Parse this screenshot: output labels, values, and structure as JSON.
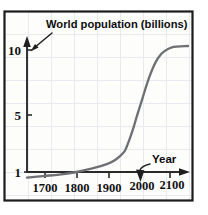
{
  "figure": {
    "name": "world-population-growth-curve",
    "background_color": "#fdfdfc",
    "border_color": "#1c1c1c",
    "grid_color": "#e7e9ee",
    "curve_color": "#6d6f72",
    "axis_color": "#2a2a2a"
  },
  "annotations": {
    "title": "World population (billions)",
    "year": "Year"
  },
  "chart_data": {
    "type": "line",
    "title": "World population (billions)",
    "xlabel": "Year",
    "ylabel": "World population (billions)",
    "xlim": [
      1650,
      2150
    ],
    "ylim": [
      0,
      12
    ],
    "grid": true,
    "legend": false,
    "xticks": [
      1700,
      1800,
      1900,
      2000,
      2100
    ],
    "xtick_labels": [
      "1700",
      "1800",
      "1900",
      "2000",
      "2100"
    ],
    "yticks": [
      1,
      5,
      10
    ],
    "ytick_labels": [
      "1",
      "5",
      "10"
    ],
    "series": [
      {
        "name": "World population",
        "x": [
          1650,
          1700,
          1750,
          1800,
          1850,
          1900,
          1925,
          1950,
          1960,
          1970,
          1980,
          1990,
          2000,
          2010,
          2020,
          2030,
          2040,
          2050,
          2060,
          2075,
          2100,
          2150
        ],
        "values": [
          0.55,
          0.68,
          0.79,
          0.98,
          1.26,
          1.65,
          1.97,
          2.54,
          3.03,
          3.7,
          4.46,
          5.33,
          6.15,
          6.96,
          7.79,
          8.55,
          9.2,
          9.74,
          10.15,
          10.55,
          10.9,
          11.0
        ]
      }
    ],
    "annotations": [
      {
        "text": "World population (billions)",
        "kind": "label-with-arrow",
        "points_to": "y-axis"
      },
      {
        "text": "Year",
        "kind": "label-with-arrow",
        "points_to": "x-axis"
      }
    ]
  }
}
